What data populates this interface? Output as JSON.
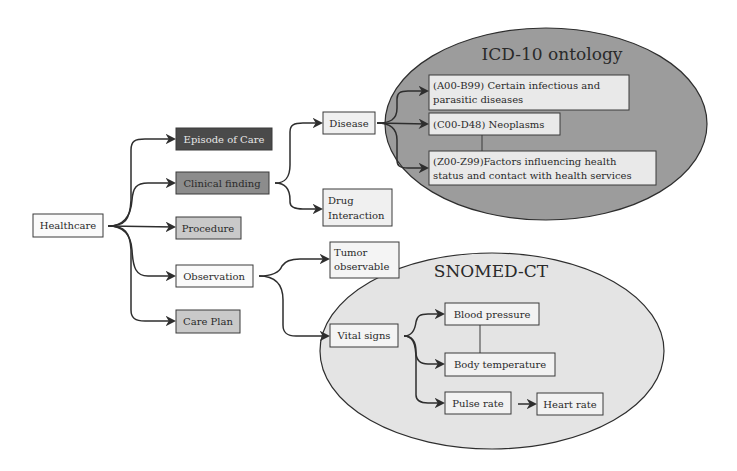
{
  "colors": {
    "dark_fill": "#4a4a4a",
    "mid_fill": "#8c8c8c",
    "light_fill": "#c9c9c9",
    "white_fill": "#fafafa",
    "icd_ellipse": "#9c9c9c",
    "snomed_ellipse": "#e4e4e4",
    "icd_box": "#e9e9e9",
    "stroke": "#2e2e2e"
  },
  "root": {
    "label": "Healthcare"
  },
  "categories": [
    {
      "id": "episode",
      "label": "Episode of Care",
      "style": "dark"
    },
    {
      "id": "clinical",
      "label": "Clinical finding",
      "style": "mid"
    },
    {
      "id": "procedure",
      "label": "Procedure",
      "style": "light"
    },
    {
      "id": "observation",
      "label": "Observation",
      "style": "white"
    },
    {
      "id": "careplan",
      "label": "Care Plan",
      "style": "light"
    }
  ],
  "clinical_children": [
    {
      "id": "disease",
      "label": "Disease"
    },
    {
      "id": "drug",
      "label_lines": [
        "Drug",
        "Interaction"
      ]
    }
  ],
  "observation_children": [
    {
      "id": "tumor",
      "label_lines": [
        "Tumor",
        "observable"
      ]
    },
    {
      "id": "vital",
      "label": "Vital signs"
    }
  ],
  "icd10": {
    "title": "ICD-10 ontology",
    "items": [
      {
        "id": "a00",
        "label_lines": [
          "(A00-B99) Certain infectious and",
          "parasitic diseases"
        ]
      },
      {
        "id": "c00",
        "label": "(C00-D48) Neoplasms"
      },
      {
        "id": "z00",
        "label_lines": [
          "(Z00-Z99)Factors influencing health",
          "status and contact with health services"
        ]
      }
    ]
  },
  "snomed": {
    "title": "SNOMED-CT",
    "items": [
      {
        "id": "bp",
        "label": "Blood pressure"
      },
      {
        "id": "bt",
        "label": "Body temperature"
      },
      {
        "id": "pulse",
        "label": "Pulse rate"
      },
      {
        "id": "heart",
        "label": "Heart rate"
      }
    ]
  }
}
